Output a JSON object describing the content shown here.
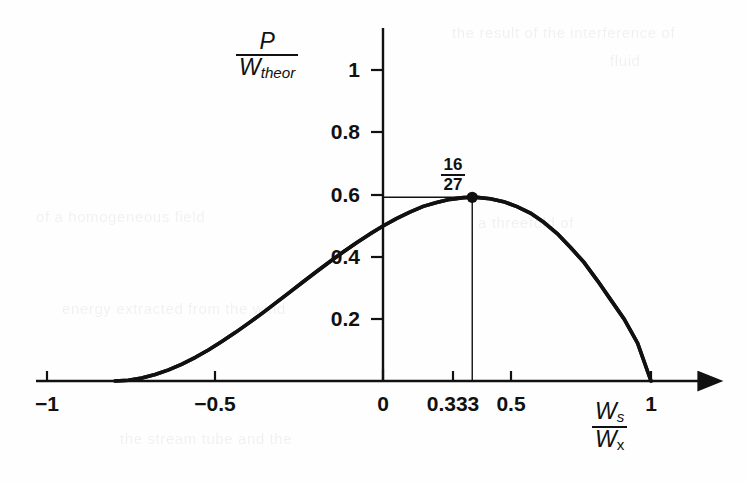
{
  "chart_data": {
    "type": "line",
    "title": "",
    "subtitle": "",
    "xlabel": "Ws/Wx",
    "ylabel": "P/Wtheor",
    "xlim": [
      -1.22,
      1.28
    ],
    "ylim": [
      -0.06,
      1.12
    ],
    "grid": false,
    "legend": null,
    "xticks": [
      {
        "value": -1,
        "label": "−1"
      },
      {
        "value": -0.5,
        "label": "−0.5"
      },
      {
        "value": 0,
        "label": "0"
      },
      {
        "value": 0.333,
        "label": "0.333"
      },
      {
        "value": 0.5,
        "label": "0.5"
      },
      {
        "value": 1,
        "label": "1"
      }
    ],
    "yticks": [
      {
        "value": 0.2,
        "label": "0.2"
      },
      {
        "value": 0.4,
        "label": "0.4"
      },
      {
        "value": 0.6,
        "label": "0.6"
      },
      {
        "value": 0.8,
        "label": "0.8"
      },
      {
        "value": 1.0,
        "label": "1"
      }
    ],
    "series": [
      {
        "name": "Betz power coefficient",
        "formula": "0.5*(1-x^2)*(1+x)",
        "x": [
          -1.0,
          -0.95,
          -0.9,
          -0.85,
          -0.8,
          -0.75,
          -0.7,
          -0.65,
          -0.6,
          -0.55,
          -0.5,
          -0.45,
          -0.4,
          -0.35,
          -0.3,
          -0.25,
          -0.2,
          -0.15,
          -0.1,
          -0.05,
          0.0,
          0.05,
          0.1,
          0.15,
          0.2,
          0.25,
          0.3,
          0.333,
          0.35,
          0.4,
          0.45,
          0.5,
          0.55,
          0.6,
          0.65,
          0.7,
          0.75,
          0.8,
          0.85,
          0.9,
          0.95,
          1.0
        ],
        "y": [
          0.0,
          0.0024,
          0.0095,
          0.0211,
          0.036,
          0.0547,
          0.0765,
          0.1009,
          0.128,
          0.1569,
          0.1875,
          0.2191,
          0.252,
          0.2852,
          0.3185,
          0.3516,
          0.384,
          0.4154,
          0.4455,
          0.4737,
          0.5,
          0.5239,
          0.5445,
          0.5633,
          0.576,
          0.5859,
          0.5915,
          0.5926,
          0.5923,
          0.588,
          0.5785,
          0.5625,
          0.5416,
          0.512,
          0.4757,
          0.4305,
          0.3828,
          0.324,
          0.2616,
          0.1995,
          0.1219,
          0.0
        ]
      }
    ],
    "annotations": [
      {
        "name": "betz-limit",
        "label_numerator": "16",
        "label_denominator": "27",
        "x": 0.333,
        "y": 0.5926,
        "marker": "filled-circle",
        "leader_to_y_axis": true,
        "leader_to_x_axis": true
      }
    ],
    "axis_arrow": {
      "x_axis": "right-arrowhead",
      "y_axis": "none"
    },
    "line_color": "#111111",
    "background_color": "#fefefe"
  },
  "axis_labels": {
    "y_numerator": "P",
    "y_denominator_base": "W",
    "y_denominator_sub": "theor",
    "x_numerator_base": "W",
    "x_numerator_sub": "s",
    "x_denominator_base": "W",
    "x_denominator_sub": "x"
  },
  "scan_artifacts": {
    "top_right_line1": "the result of the interference of",
    "top_right_line2": "fluid",
    "mid_left_line": "of a homogeneous field",
    "mid_right_line": "a threefold of",
    "lower_line": "energy extracted from the wind",
    "bottom_line": "the stream tube and the"
  }
}
